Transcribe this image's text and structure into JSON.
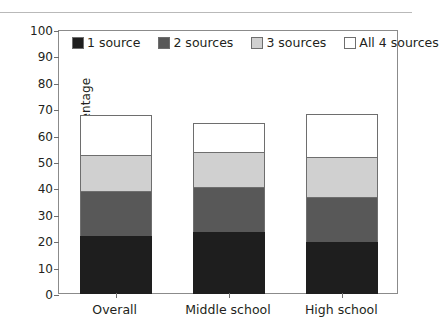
{
  "chart_data": {
    "type": "bar",
    "stacked": true,
    "title": "",
    "xlabel": "",
    "ylabel": "Percentage",
    "ylim": [
      0,
      100
    ],
    "yticks": [
      0,
      10,
      20,
      30,
      40,
      50,
      60,
      70,
      80,
      90,
      100
    ],
    "ytick_labels": [
      "0",
      "10",
      "20",
      "30",
      "40",
      "50",
      "60",
      "70",
      "80",
      "90",
      "100"
    ],
    "grid": false,
    "legend_position": "upper-left-inside",
    "categories": [
      "Overall",
      "Middle school",
      "High school"
    ],
    "series": [
      {
        "name": "1 source",
        "color": "#1e1e1e",
        "values": [
          22.0,
          23.5,
          19.7
        ]
      },
      {
        "name": "2 sources",
        "color": "#585858",
        "values": [
          17.4,
          17.4,
          17.4
        ]
      },
      {
        "name": "3 sources",
        "color": "#d0d0d0",
        "values": [
          14.0,
          13.6,
          15.6
        ]
      },
      {
        "name": "All 4 sources",
        "color": "#ffffff",
        "values": [
          15.5,
          11.5,
          16.6
        ]
      }
    ],
    "cumulative_totals": [
      68.9,
      66.0,
      69.3
    ]
  },
  "axis": {
    "y_title": "Percentage"
  },
  "legend": {
    "items": [
      {
        "label": "1 source"
      },
      {
        "label": "2 sources"
      },
      {
        "label": "3 sources"
      },
      {
        "label": "All 4 sources"
      }
    ]
  }
}
